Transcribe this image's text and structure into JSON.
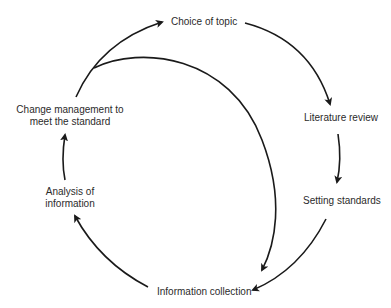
{
  "diagram": {
    "type": "cycle",
    "nodes": [
      {
        "id": "choice",
        "label": "Choice of topic"
      },
      {
        "id": "literature",
        "label": "Literature review"
      },
      {
        "id": "setting",
        "label": "Setting standards"
      },
      {
        "id": "collection",
        "label": "Information collection"
      },
      {
        "id": "analysis",
        "label_line1": "Analysis of",
        "label_line2": "information"
      },
      {
        "id": "change",
        "label_line1": "Change management to",
        "label_line2": "meet the standard"
      }
    ],
    "edges": [
      {
        "from": "choice",
        "to": "literature"
      },
      {
        "from": "literature",
        "to": "setting"
      },
      {
        "from": "setting",
        "to": "collection"
      },
      {
        "from": "collection",
        "to": "analysis"
      },
      {
        "from": "analysis",
        "to": "change"
      },
      {
        "from": "change",
        "to": "choice"
      },
      {
        "from": "change",
        "to": "collection"
      }
    ],
    "colors": {
      "line": "#1a1a1a",
      "text": "#2b2b2b",
      "background": "#ffffff"
    }
  }
}
